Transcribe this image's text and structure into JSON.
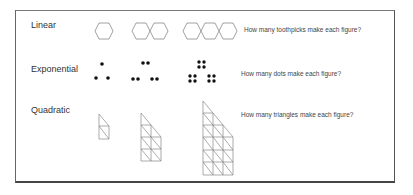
{
  "rows": [
    {
      "label": "Linear",
      "question": "How many toothpicks make each figure?",
      "figure_icon": "hexagon-chain-icon",
      "figures": [
        1,
        2,
        3
      ]
    },
    {
      "label": "Exponential",
      "question": "How many dots make each figure?",
      "figure_icon": "dot-cluster-icon",
      "figures": [
        3,
        6,
        12
      ]
    },
    {
      "label": "Quadratic",
      "question": "How many triangles make each figure?",
      "figure_icon": "triangle-staircase-icon",
      "figures": [
        1,
        2,
        3
      ]
    }
  ],
  "colors": {
    "figure_stroke": "#888888",
    "dot_fill": "#111111",
    "frame_border": "#555555"
  }
}
